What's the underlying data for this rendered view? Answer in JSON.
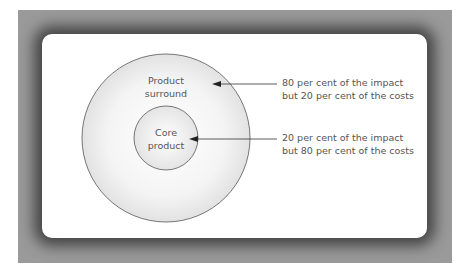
{
  "diagram": {
    "outer_circle": {
      "label_line1": "Product",
      "label_line2": "surround",
      "annotation_line1": "80 per cent of the impact",
      "annotation_line2": "but 20 per cent of the costs"
    },
    "inner_circle": {
      "label_line1": "Core",
      "label_line2": "product",
      "annotation_line1": "20 per cent of the impact",
      "annotation_line2": "but 80 per cent of the costs"
    }
  },
  "colors": {
    "frame": "#9a9a9a",
    "panel": "#ffffff",
    "circle_fill": "#ededed",
    "stroke": "#555555",
    "text": "#555555"
  }
}
